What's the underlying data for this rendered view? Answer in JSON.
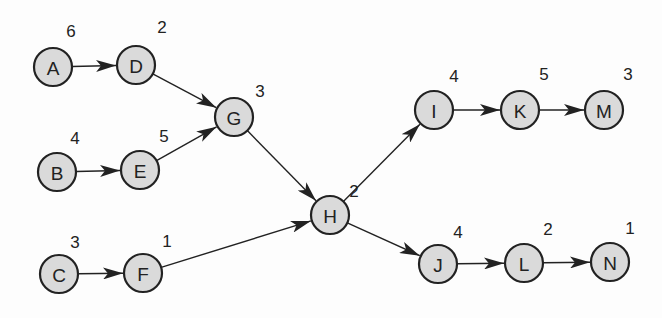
{
  "diagram": {
    "type": "directed-network",
    "nodes": [
      {
        "id": "A",
        "weight": "6"
      },
      {
        "id": "B",
        "weight": "4"
      },
      {
        "id": "C",
        "weight": "3"
      },
      {
        "id": "D",
        "weight": "2"
      },
      {
        "id": "E",
        "weight": "5"
      },
      {
        "id": "F",
        "weight": "1"
      },
      {
        "id": "G",
        "weight": "3"
      },
      {
        "id": "H",
        "weight": "2"
      },
      {
        "id": "I",
        "weight": "4"
      },
      {
        "id": "J",
        "weight": "4"
      },
      {
        "id": "K",
        "weight": "5"
      },
      {
        "id": "L",
        "weight": "2"
      },
      {
        "id": "M",
        "weight": "3"
      },
      {
        "id": "N",
        "weight": "1"
      }
    ],
    "edges": [
      [
        "A",
        "D"
      ],
      [
        "D",
        "G"
      ],
      [
        "B",
        "E"
      ],
      [
        "E",
        "G"
      ],
      [
        "C",
        "F"
      ],
      [
        "F",
        "H"
      ],
      [
        "G",
        "H"
      ],
      [
        "H",
        "I"
      ],
      [
        "H",
        "J"
      ],
      [
        "I",
        "K"
      ],
      [
        "K",
        "M"
      ],
      [
        "J",
        "L"
      ],
      [
        "L",
        "N"
      ]
    ]
  }
}
